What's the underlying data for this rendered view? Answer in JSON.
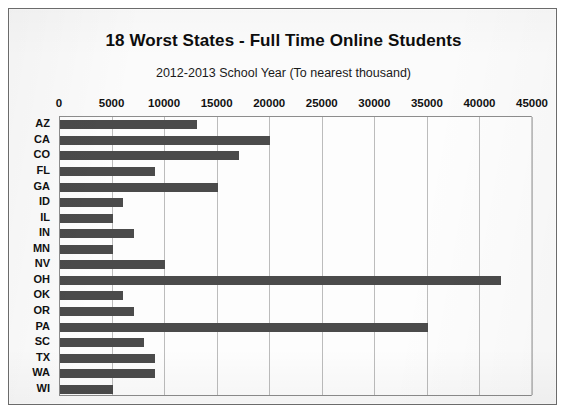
{
  "chart_data": {
    "type": "bar",
    "orientation": "horizontal",
    "title": "18 Worst States - Full Time Online Students",
    "subtitle": "2012-2013 School Year (To nearest thousand)",
    "xlabel": "",
    "ylabel": "",
    "xlim": [
      0,
      45000
    ],
    "ylim": null,
    "grid": true,
    "legend": null,
    "xticks": [
      0,
      5000,
      10000,
      15000,
      20000,
      25000,
      30000,
      35000,
      40000,
      45000
    ],
    "xtick_labels": [
      "0",
      "5000",
      "10000",
      "15000",
      "20000",
      "25000",
      "30000",
      "35000",
      "40000",
      "45000"
    ],
    "categories": [
      "AZ",
      "CA",
      "CO",
      "FL",
      "GA",
      "ID",
      "IL",
      "IN",
      "MN",
      "NV",
      "OH",
      "OK",
      "OR",
      "PA",
      "SC",
      "TX",
      "WA",
      "WI"
    ],
    "values": [
      13000,
      20000,
      17000,
      9000,
      15000,
      6000,
      5000,
      7000,
      5000,
      10000,
      42000,
      6000,
      7000,
      35000,
      8000,
      9000,
      9000,
      5000
    ],
    "series": [
      {
        "name": "Full Time Online Students",
        "values": [
          13000,
          20000,
          17000,
          9000,
          15000,
          6000,
          5000,
          7000,
          5000,
          10000,
          42000,
          6000,
          7000,
          35000,
          8000,
          9000,
          9000,
          5000
        ]
      }
    ],
    "bar_color": "#4b4b4b",
    "plot_background": "#fdfdfd",
    "gridline_color": "#bcbcbc",
    "axis_color": "#8d8d8d"
  }
}
